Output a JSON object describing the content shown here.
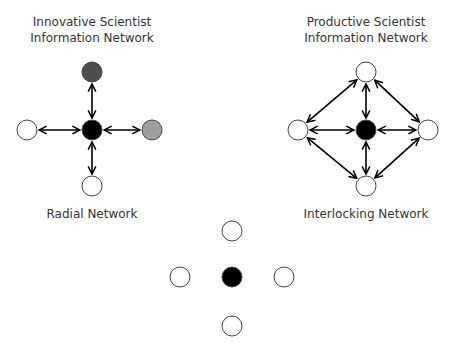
{
  "diagram": {
    "left": {
      "title_line1": "Innovative Scientist",
      "title_line2": "Information Network",
      "caption": "Radial Network",
      "nodes": {
        "center": {
          "x": 92,
          "y": 130,
          "fill": "#000000"
        },
        "top": {
          "x": 92,
          "y": 72,
          "fill": "#4d4d4d"
        },
        "right": {
          "x": 152,
          "y": 130,
          "fill": "#a0a0a0"
        },
        "left": {
          "x": 27,
          "y": 130,
          "fill": "#ffffff"
        },
        "bottom": {
          "x": 92,
          "y": 186,
          "fill": "#ffffff"
        }
      }
    },
    "right": {
      "title_line1": "Productive Scientist",
      "title_line2": "Information Network",
      "caption": "Interlocking Network",
      "nodes": {
        "center": {
          "x": 366,
          "y": 130,
          "fill": "#000000"
        },
        "top": {
          "x": 366,
          "y": 72,
          "fill": "#ffffff"
        },
        "right": {
          "x": 428,
          "y": 130,
          "fill": "#ffffff"
        },
        "left": {
          "x": 298,
          "y": 130,
          "fill": "#ffffff"
        },
        "bottom": {
          "x": 366,
          "y": 186,
          "fill": "#ffffff"
        }
      }
    },
    "bottom": {
      "nodes": {
        "center": {
          "x": 232,
          "y": 277,
          "fill": "#000000"
        },
        "top": {
          "x": 232,
          "y": 231,
          "fill": "#ffffff"
        },
        "right": {
          "x": 284,
          "y": 277,
          "fill": "#ffffff"
        },
        "left": {
          "x": 180,
          "y": 277,
          "fill": "#ffffff"
        },
        "bottom": {
          "x": 232,
          "y": 326,
          "fill": "#ffffff"
        }
      }
    }
  }
}
